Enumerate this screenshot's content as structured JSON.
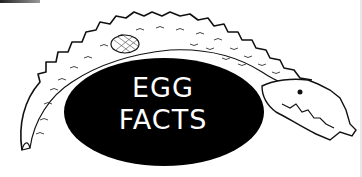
{
  "illustration": {
    "title_line1": "EGG",
    "title_line2": "FACTS",
    "subject": "crocodile-wrapped-around-egg",
    "colors": {
      "background": "#ffffff",
      "egg": "#000000",
      "text": "#ffffff",
      "linework": "#111111"
    }
  }
}
